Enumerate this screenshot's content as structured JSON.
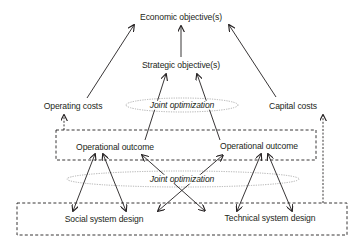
{
  "diagram": {
    "nodes": {
      "economic": "Economic objective(s)",
      "strategic": "Strategic objective(s)",
      "operating_costs": "Operating costs",
      "capital_costs": "Capital costs",
      "operational_outcome_left": "Operational outcome",
      "operational_outcome_right": "Operational outcome",
      "social_design": "Social system design",
      "technical_design": "Technical system design"
    },
    "ellipses": {
      "top": "Joint optimization",
      "bottom": "Joint optimization"
    },
    "colors": {
      "line": "#231f20",
      "ellipse": "#9a9a9a",
      "background": "#ffffff"
    }
  }
}
